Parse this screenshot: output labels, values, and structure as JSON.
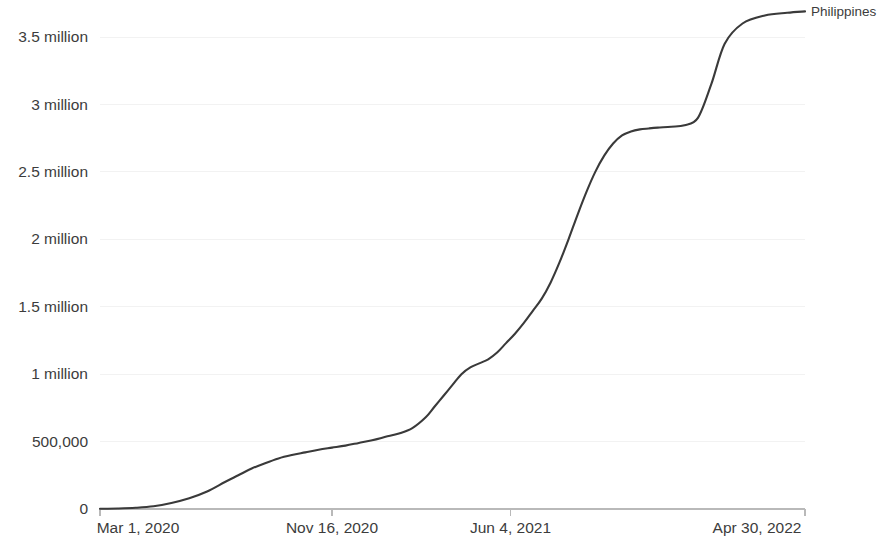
{
  "chart_data": {
    "type": "line",
    "title": "",
    "subtitle": "",
    "xlabel": "",
    "ylabel": "",
    "grid": true,
    "legend_position": "right-end-of-line",
    "line_color": "#3a3a3a",
    "axis_color": "#b9b9b9",
    "gridline_color": "#f2f2f2",
    "y_tick_labels": [
      "3.5 million",
      "3 million",
      "2.5 million",
      "2 million",
      "1.5 million",
      "1 million",
      "500,000",
      "0"
    ],
    "y_tick_values": [
      3500000,
      3000000,
      2500000,
      2000000,
      1500000,
      1000000,
      500000,
      0
    ],
    "ylim": [
      0,
      3700000
    ],
    "x_tick_labels": [
      "Mar 1, 2020",
      "Nov 16, 2020",
      "Jun 4, 2021",
      "Apr 30, 2022"
    ],
    "x_tick_days": [
      0,
      260,
      460,
      790
    ],
    "xlim": [
      0,
      790
    ],
    "series": [
      {
        "name": "Philippines",
        "color": "#3a3a3a",
        "x": [
          0,
          20,
          40,
          60,
          80,
          100,
          120,
          140,
          155,
          170,
          185,
          200,
          215,
          230,
          245,
          260,
          275,
          290,
          305,
          320,
          335,
          350,
          365,
          375,
          385,
          395,
          405,
          415,
          425,
          435,
          445,
          455,
          465,
          475,
          485,
          495,
          505,
          515,
          525,
          535,
          545,
          555,
          565,
          575,
          585,
          595,
          605,
          615,
          625,
          640,
          655,
          670,
          685,
          700,
          720,
          745,
          770,
          790
        ],
        "values": [
          2000,
          4000,
          9000,
          20000,
          45000,
          80000,
          130000,
          200000,
          250000,
          300000,
          340000,
          375000,
          400000,
          420000,
          440000,
          455000,
          470000,
          490000,
          510000,
          535000,
          560000,
          600000,
          680000,
          760000,
          840000,
          920000,
          1000000,
          1050000,
          1080000,
          1110000,
          1160000,
          1230000,
          1300000,
          1380000,
          1470000,
          1560000,
          1680000,
          1830000,
          2000000,
          2180000,
          2350000,
          2500000,
          2620000,
          2710000,
          2770000,
          2800000,
          2815000,
          2822000,
          2828000,
          2835000,
          2845000,
          2900000,
          3150000,
          3450000,
          3600000,
          3660000,
          3680000,
          3690000
        ]
      }
    ],
    "annotations": [
      {
        "text": "Philippines",
        "anchor": "end-of-line"
      }
    ]
  },
  "axis": {
    "y_labels": [
      "3.5 million",
      "3 million",
      "2.5 million",
      "2 million",
      "1.5 million",
      "1 million",
      "500,000",
      "0"
    ],
    "x_labels": [
      "Mar 1, 2020",
      "Nov 16, 2020",
      "Jun 4, 2021",
      "Apr 30, 2022"
    ]
  },
  "legend": {
    "series_label": "Philippines"
  }
}
